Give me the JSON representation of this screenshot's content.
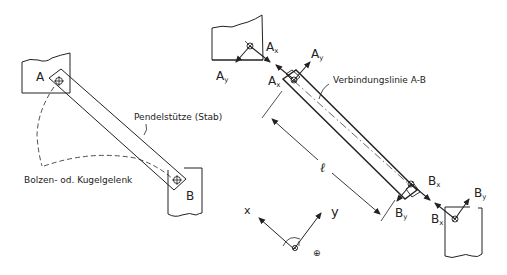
{
  "left_figure": {
    "support_a_label": "A",
    "support_b_label": "B",
    "rod_label": "Pendelstütze (Stab)",
    "joint_label": "Bolzen- od. Kugelgelenk"
  },
  "right_figure": {
    "line_label": "Verbindungslinie A-B",
    "length_label": "ℓ",
    "forces": {
      "ax_wall": {
        "main": "A",
        "sub": "x"
      },
      "ay_wall": {
        "main": "A",
        "sub": "y"
      },
      "ax_rod": {
        "main": "A",
        "sub": "x"
      },
      "ay_rod": {
        "main": "A",
        "sub": "y"
      },
      "bx_rod": {
        "main": "B",
        "sub": "x"
      },
      "by_rod": {
        "main": "B",
        "sub": "y"
      },
      "bx_wall": {
        "main": "B",
        "sub": "x"
      },
      "by_wall": {
        "main": "B",
        "sub": "y"
      }
    }
  },
  "coordinate_system": {
    "x_label": "x",
    "y_label": "y",
    "moment_sign": "⊕"
  },
  "colors": {
    "ink": "#222222",
    "background": "#ffffff"
  }
}
